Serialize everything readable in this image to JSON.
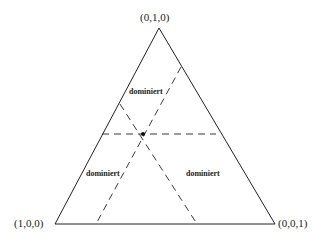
{
  "diagram": {
    "type": "simplex-triangle",
    "vertices": {
      "top": "(0,1,0)",
      "bottom_left": "(1,0,0)",
      "bottom_right": "(0,0,1)"
    },
    "regions": [
      {
        "label": "dominiert",
        "position": "upper"
      },
      {
        "label": "dominiert",
        "position": "lower-left"
      },
      {
        "label": "dominiert",
        "position": "lower-right"
      }
    ],
    "point": {
      "x": 143,
      "y": 134
    },
    "colors": {
      "line": "#222222",
      "background": "#ffffff"
    }
  }
}
